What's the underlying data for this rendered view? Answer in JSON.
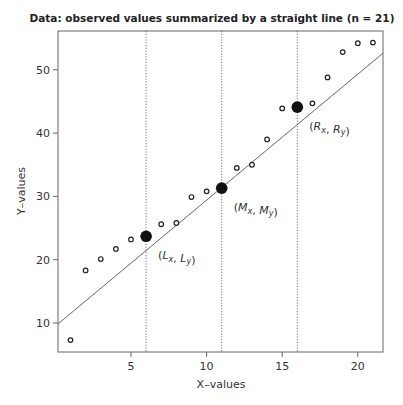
{
  "chart_data": {
    "type": "scatter",
    "title": "Data: observed values summarized by a straight line (n = 21)",
    "xlabel": "X–values",
    "ylabel": "Y–values",
    "xlim": [
      0.15,
      21.7
    ],
    "ylim": [
      5.4,
      56.1
    ],
    "xticks": [
      5,
      10,
      15,
      20
    ],
    "yticks": [
      10,
      20,
      30,
      40,
      50
    ],
    "grid": false,
    "legend": null,
    "series": [
      {
        "name": "observed",
        "marker": "open-circle",
        "x": [
          1,
          2,
          3,
          4,
          5,
          7,
          8,
          9,
          10,
          12,
          13,
          14,
          15,
          17,
          18,
          19,
          20,
          21
        ],
        "y": [
          7.3,
          18.3,
          20.1,
          21.7,
          23.2,
          25.6,
          25.8,
          29.9,
          30.8,
          34.5,
          35.0,
          39.0,
          43.9,
          44.7,
          48.8,
          52.8,
          54.2,
          54.3
        ]
      },
      {
        "name": "summary points",
        "marker": "filled-circle",
        "points": [
          {
            "label_main": "L",
            "x": 6,
            "y": 23.7,
            "label": "(Lx, Ly)"
          },
          {
            "label_main": "M",
            "x": 11,
            "y": 31.3,
            "label": "(Mx, My)"
          },
          {
            "label_main": "R",
            "x": 16,
            "y": 44.1,
            "label": "(Rx, Ry)"
          }
        ]
      }
    ],
    "fit_line": {
      "intercept": 9.55,
      "slope": 1.985
    },
    "vertical_reference_lines": [
      6,
      11,
      16
    ]
  }
}
